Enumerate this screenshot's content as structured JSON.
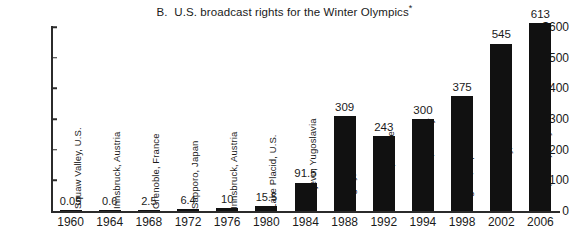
{
  "chart_data": {
    "type": "bar",
    "title": "B.  U.S. broadcast rights for the Winter Olympics*",
    "title_prefix": "B.  U.S. broadcast rights for the Winter Olympics",
    "title_footnote_marker": "*",
    "xlabel": "",
    "ylabel": "",
    "ylim": [
      0,
      600
    ],
    "ytick_labels": [
      "$600",
      "500",
      "400",
      "300",
      "200",
      "100",
      "0"
    ],
    "ytick_values": [
      600,
      500,
      400,
      300,
      200,
      100,
      0
    ],
    "grid": false,
    "legend": "none",
    "categories": [
      "1960",
      "1964",
      "1968",
      "1972",
      "1976",
      "1980",
      "1984",
      "1988",
      "1992",
      "1994",
      "1998",
      "2002",
      "2006"
    ],
    "values": [
      0.05,
      0.6,
      2.5,
      6.4,
      10,
      15.5,
      91.5,
      309,
      243,
      300,
      375,
      545,
      613
    ],
    "value_labels": [
      "0.05",
      "0.6",
      "2.5",
      "6.4",
      "10",
      "15.5",
      "91.5",
      "309",
      "243",
      "300",
      "375",
      "545",
      "613"
    ],
    "venues": [
      "Squaw Valley, U.S.",
      "Innsbruck, Austria",
      "Grenoble, France",
      "Sapporo, Japan",
      "Innsbruck, Austria",
      "Lake Placid, U.S.",
      "Sarajevo, Yugoslavia",
      "Calgary, Canada",
      "Albertville, France",
      "Lillehammer, Norway",
      "Nagano, Japan",
      "Salt Lake City, U.S.",
      "Turin(Torino), Italy"
    ],
    "bar_color": "#111111",
    "axis_color": "#2b2b2b",
    "background_color": "#ffffff",
    "units_note": "millions of U.S. dollars"
  }
}
